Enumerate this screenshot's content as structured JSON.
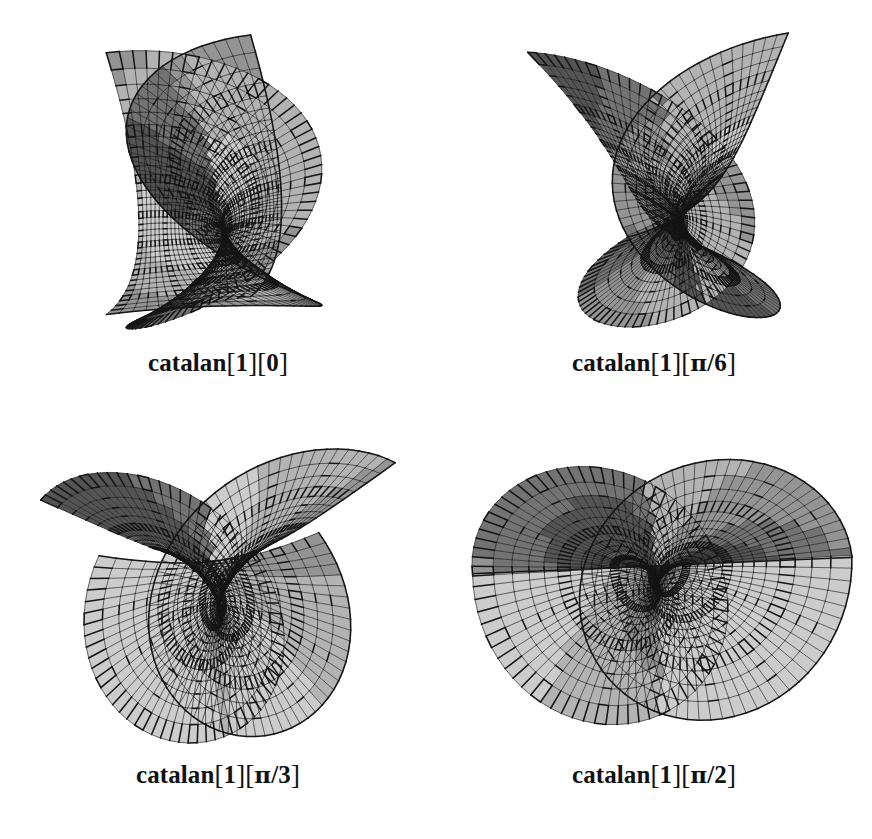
{
  "figure": {
    "background_color": "#ffffff",
    "ink_color": "#111111",
    "surface_fill_light": "#c9c9c9",
    "surface_fill_mid": "#9a9a9a",
    "surface_fill_dark": "#4a4a4a",
    "mesh_line_color": "#151515",
    "rows": 2,
    "columns": 2
  },
  "panels": [
    {
      "id": "catalan-1-0",
      "caption_full": "catalan[1][0]",
      "caption_name": "catalan",
      "caption_index": "1",
      "caption_param_text": "0",
      "caption_param_numer": "",
      "caption_param_denom": "",
      "param_value": 0,
      "param_label": "0"
    },
    {
      "id": "catalan-1-pi-6",
      "caption_full": "catalan[1][π/6]",
      "caption_name": "catalan",
      "caption_index": "1",
      "caption_param_text": "π/6",
      "caption_param_numer": "π",
      "caption_param_denom": "6",
      "param_value": 0.5235987755982988,
      "param_label": "π/6"
    },
    {
      "id": "catalan-1-pi-3",
      "caption_full": "catalan[1][π/3]",
      "caption_name": "catalan",
      "caption_index": "1",
      "caption_param_text": "π/3",
      "caption_param_numer": "π",
      "caption_param_denom": "3",
      "param_value": 1.0471975511965976,
      "param_label": "π/3"
    },
    {
      "id": "catalan-1-pi-2",
      "caption_full": "catalan[1][π/2]",
      "caption_name": "catalan",
      "caption_index": "1",
      "caption_param_text": "π/2",
      "caption_param_numer": "π",
      "caption_param_denom": "2",
      "param_value": 1.5707963267948966,
      "param_label": "π/2"
    }
  ],
  "chart_data": {
    "type": "surface",
    "title": "",
    "subtitle": "",
    "surface_name": "catalan",
    "surface_index": 1,
    "series": [
      {
        "name": "catalan[1][0]",
        "theta": 0,
        "theta_label": "0"
      },
      {
        "name": "catalan[1][π/6]",
        "theta": 0.5235987755982988,
        "theta_label": "π/6"
      },
      {
        "name": "catalan[1][π/3]",
        "theta": 1.0471975511965976,
        "theta_label": "π/3"
      },
      {
        "name": "catalan[1][π/2]",
        "theta": 1.5707963267948966,
        "theta_label": "π/2"
      }
    ],
    "parametrization": {
      "u_range": [
        -3.15,
        3.15
      ],
      "v_range": [
        -2.4,
        2.4
      ],
      "u_divisions": 72,
      "v_divisions": 34,
      "major_u_every": 6,
      "major_v_every": 5
    },
    "render": {
      "shading": "flat-gray-halftone",
      "wireframe": true,
      "legend": false,
      "axes": false,
      "grid": false,
      "projection": "orthographic"
    },
    "xlabel": "",
    "ylabel": "",
    "zlabel": ""
  }
}
